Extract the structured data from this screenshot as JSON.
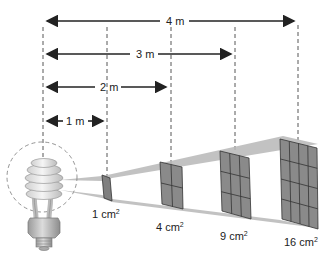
{
  "diagram": {
    "distances": [
      {
        "label": "1 m",
        "x1": 45,
        "x2": 104,
        "y": 121,
        "tx": 60
      },
      {
        "label": "2 m",
        "x1": 45,
        "x2": 167,
        "y": 87,
        "tx": 105
      },
      {
        "label": "3 m",
        "x1": 45,
        "x2": 232,
        "y": 54,
        "tx": 143
      },
      {
        "label": "4 m",
        "x1": 45,
        "x2": 295,
        "y": 21,
        "tx": 183
      }
    ],
    "areas": [
      {
        "label": "1 cm",
        "sup": "2",
        "grid": 1
      },
      {
        "label": "4 cm",
        "sup": "2",
        "grid": 2
      },
      {
        "label": "9 cm",
        "sup": "2",
        "grid": 3
      },
      {
        "label": "16 cm",
        "sup": "2",
        "grid": 4
      }
    ],
    "colors": {
      "line": "#222222",
      "beam": "#b5b5b5",
      "square_fill": "#8a8a8a",
      "square_edge": "#333333",
      "bulb": "#e2e2e2"
    }
  }
}
